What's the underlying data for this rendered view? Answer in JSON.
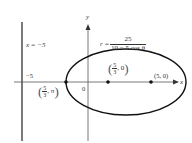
{
  "figure": {
    "type": "polar conic (ellipse) diagram",
    "equation": {
      "lhs": "r =",
      "numerator": "25",
      "denominator": "10 − 5 cos θ"
    },
    "directrix_label": "x = −5",
    "axes": {
      "x_label": "x",
      "y_label": "y",
      "origin_label": "0",
      "tick_label_neg5": "−5"
    },
    "points": [
      {
        "name": "left-vertex",
        "label_num": "5",
        "label_den": "3",
        "label_rest": ", π",
        "polar": "(5/3, π)"
      },
      {
        "name": "center",
        "label_num": "5",
        "label_den": "3",
        "label_rest": ", 0",
        "polar": "(5/3, 0)"
      },
      {
        "name": "right-vertex",
        "label": "(5, 0)"
      }
    ],
    "colors": {
      "curve": "#111111",
      "axes": "#555555",
      "text": "#333333"
    }
  }
}
